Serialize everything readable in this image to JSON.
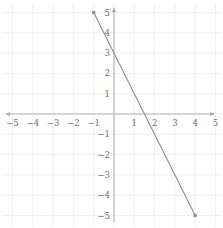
{
  "chart_data": {
    "type": "line",
    "title": "",
    "xlabel": "",
    "ylabel": "",
    "xlim": [
      -5,
      5
    ],
    "ylim": [
      -5,
      5
    ],
    "grid": true,
    "legend": null,
    "x_ticks": [
      -5,
      -4,
      -3,
      -2,
      -1,
      1,
      2,
      3,
      4,
      5
    ],
    "y_ticks": [
      5,
      4,
      3,
      2,
      1,
      -1,
      -2,
      -3,
      -4,
      -5
    ],
    "x_tick_labels": [
      "−5",
      "−4",
      "−3",
      "−2",
      "−1",
      "1",
      "2",
      "3",
      "4",
      "5"
    ],
    "y_tick_labels": [
      "5",
      "4",
      "3",
      "2",
      "1",
      "−1",
      "−2",
      "−3",
      "−4",
      "−5"
    ],
    "series": [
      {
        "name": "y = -2x + 3",
        "equation": "y = -2x + 3",
        "slope": -2,
        "y_intercept": 3,
        "x_intercept": 1.5,
        "x": [
          -1,
          4
        ],
        "values": [
          5,
          -5
        ],
        "endpoints": [
          {
            "x": -1,
            "y": 5
          },
          {
            "x": 4,
            "y": -5
          }
        ],
        "color": "#8d8d96",
        "endpoint_marker": "square"
      }
    ]
  },
  "axes": {
    "origin_label": "",
    "x_axis_name": "x-axis",
    "y_axis_name": "y-axis",
    "arrowheads": true,
    "axis_color": "#b4b4ba",
    "grid_color": "#f0f0f4",
    "tick_label_color": "#6f6f74"
  }
}
